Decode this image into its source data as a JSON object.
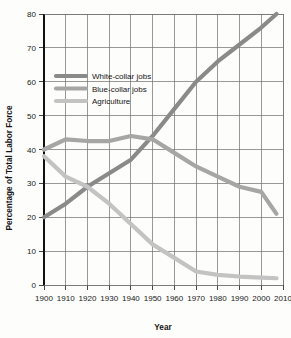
{
  "chart_data": {
    "type": "line",
    "title": "",
    "xlabel": "Year",
    "ylabel": "Percentage of Total Labor Force",
    "xlim": [
      1900,
      2010
    ],
    "ylim": [
      0,
      80
    ],
    "grid": "both",
    "legend_position": "upper-left-inside",
    "x_ticks": [
      1900,
      1910,
      1920,
      1930,
      1940,
      1950,
      1960,
      1970,
      1980,
      1990,
      2000,
      2010
    ],
    "y_ticks": [
      0,
      10,
      20,
      30,
      40,
      50,
      60,
      70,
      80
    ],
    "x": [
      1900,
      1910,
      1920,
      1930,
      1940,
      1950,
      1960,
      1970,
      1980,
      1990,
      2000,
      2007
    ],
    "series": [
      {
        "name": "White-collar jobs",
        "color": "#8a8a8a",
        "values": [
          20,
          24,
          29,
          33,
          37,
          44,
          52,
          60,
          66,
          71,
          76,
          80
        ]
      },
      {
        "name": "Blue-collar jobs",
        "color": "#a6a6a6",
        "values": [
          40,
          43,
          42.5,
          42.5,
          44,
          43,
          39,
          35,
          32,
          29,
          27.5,
          21
        ]
      },
      {
        "name": "Agriculture",
        "color": "#c3c3c3",
        "values": [
          38,
          32,
          29,
          24,
          18,
          12,
          8,
          4,
          3,
          2.5,
          2.2,
          2
        ]
      }
    ]
  },
  "axes": {
    "x_title": "Year",
    "y_title": "Percentage of Total Labor Force",
    "x_tick_labels": [
      "1900",
      "1910",
      "1920",
      "1930",
      "1940",
      "1950",
      "1960",
      "1970",
      "1980",
      "1990",
      "2000",
      "2010"
    ],
    "y_tick_labels": [
      "0",
      "10",
      "20",
      "30",
      "40",
      "50",
      "60",
      "70",
      "80"
    ]
  },
  "legend": {
    "items": [
      {
        "label": "White-collar jobs",
        "color": "#8a8a8a"
      },
      {
        "label": "Blue-collar jobs",
        "color": "#a6a6a6"
      },
      {
        "label": "Agriculture",
        "color": "#c3c3c3"
      }
    ]
  },
  "colors": {
    "background": "#fdfdfb",
    "grid": "#6d6d6d",
    "spine": "#111111",
    "text": "#141414"
  }
}
